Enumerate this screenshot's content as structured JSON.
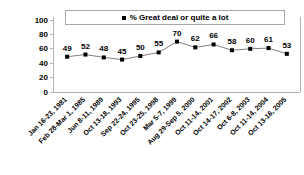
{
  "chart_data": {
    "type": "line",
    "title": "",
    "subtitle": "",
    "xlabel": "",
    "ylabel": "",
    "ylim": [
      0,
      100
    ],
    "yticks": [
      "0",
      "20",
      "40",
      "60",
      "80",
      "100"
    ],
    "grid": false,
    "legend_position": "top",
    "marker": "square",
    "categories": [
      "Jan 16-23, 1981",
      "Feb 28-Mar 1, 1985",
      "Jun 8-11, 1989",
      "Oct 13-18, 1993",
      "Sep 22-24, 1995",
      "Oct 23-25, 1998",
      "Mar 5-7, 1999",
      "Aug 29-Sep 5, 2000",
      "Oct 11-14, 2001",
      "Oct 14-17, 2002",
      "Oct 6-8, 2003",
      "Oct 11-14, 2004",
      "Oct 13-16, 2005"
    ],
    "series": [
      {
        "name": "% Great deal or quite a lot",
        "values": [
          49,
          52,
          48,
          45,
          50,
          55,
          70,
          62,
          66,
          58,
          60,
          61,
          53
        ]
      }
    ],
    "data_labels": [
      "49",
      "52",
      "48",
      "45",
      "50",
      "55",
      "70",
      "62",
      "66",
      "58",
      "60",
      "61",
      "53"
    ]
  },
  "legend": {
    "entries": [
      {
        "label": "% Great deal or quite a lot",
        "color": "#000000"
      }
    ]
  },
  "colors": {
    "marker": "#000000",
    "line": "#808080",
    "axis": "#b4b4b4",
    "text": "#000000",
    "background": "#ffffff"
  }
}
